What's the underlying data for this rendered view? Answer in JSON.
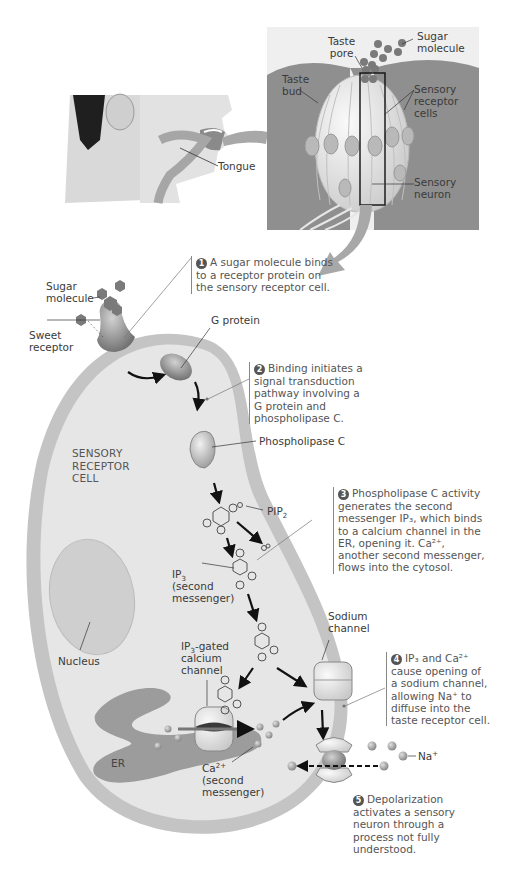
{
  "overview": {
    "labels": {
      "taste_pore": [
        "Taste",
        "pore"
      ],
      "sugar_molecule": [
        "Sugar",
        "molecule"
      ],
      "taste_bud": [
        "Taste",
        "bud"
      ],
      "sensory_receptor_cells": [
        "Sensory",
        "receptor",
        "cells"
      ],
      "sensory_neuron": [
        "Sensory",
        "neuron"
      ],
      "tongue": "Tongue"
    }
  },
  "cell": {
    "title": [
      "SENSORY",
      "RECEPTOR",
      "CELL"
    ],
    "labels": {
      "sugar_molecule": [
        "Sugar",
        "molecule"
      ],
      "sweet_receptor": [
        "Sweet",
        "receptor"
      ],
      "g_protein": "G protein",
      "phospholipase_c": "Phospholipase C",
      "pip2": "PIP",
      "pip2_sub": "2",
      "ip3": "IP",
      "ip3_sub": "3",
      "ip3_note": [
        "(second",
        "messenger)"
      ],
      "nucleus": "Nucleus",
      "ip3_gated_prefix": "IP",
      "ip3_gated_sub": "3",
      "ip3_gated_rest": "-gated",
      "ip3_gated_lines": [
        "calcium",
        "channel"
      ],
      "sodium_channel": [
        "Sodium",
        "channel"
      ],
      "er": "ER",
      "ca": "Ca",
      "ca_sup": "2+",
      "ca_note": [
        "(second",
        "messenger)"
      ],
      "na": "Na",
      "na_sup": "+"
    }
  },
  "steps": [
    {
      "number": "1",
      "lines": [
        "A sugar molecule binds",
        "to a receptor protein on",
        "the sensory receptor cell."
      ]
    },
    {
      "number": "2",
      "lines": [
        "Binding initiates a",
        "signal transduction",
        "pathway involving a",
        "G protein and",
        "phospholipase C."
      ]
    },
    {
      "number": "3",
      "lines": [
        "Phospholipase C activity",
        "generates the second",
        "messenger IP₃, which binds",
        "to a calcium channel in the",
        "ER, opening it. Ca²⁺,",
        "another second messenger,",
        "flows into the cytosol."
      ]
    },
    {
      "number": "4",
      "lines": [
        "IP₃ and Ca²⁺",
        "cause opening of",
        "a sodium channel,",
        "allowing Na⁺ to",
        "diffuse into the",
        "taste receptor cell."
      ]
    },
    {
      "number": "5",
      "lines": [
        "Depolarization",
        "activates a sensory",
        "neuron through a",
        "process not fully",
        "understood."
      ]
    }
  ],
  "colors": {
    "tissue": "#8f8f8f",
    "bud": "#e9e9e9",
    "membrane": "#c4c4c4",
    "cytosol": "#e6e6e6",
    "molecule": "#7a7a7a",
    "arrow_gray": "#a8a8a8",
    "text": "#3a3a3a"
  }
}
